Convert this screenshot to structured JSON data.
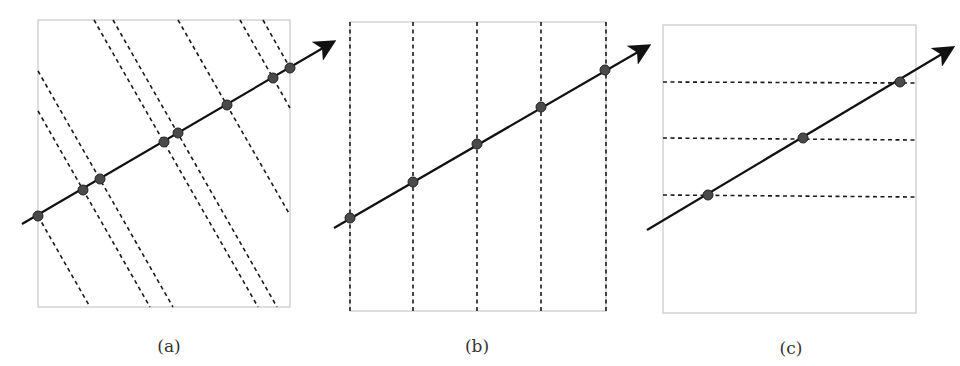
{
  "figure": {
    "panels": [
      {
        "id": "a",
        "label": "(a)",
        "label_pos": [
          169,
          350
        ],
        "box": {
          "x0": 38,
          "y0": 20,
          "x1": 290,
          "y1": 307
        },
        "axis": {
          "from": [
            22,
            224
          ],
          "to": [
            323,
            48
          ]
        },
        "projection": "oblique",
        "dashed_lines": [
          {
            "from": [
              38,
              216
            ],
            "to": [
              90,
              307
            ]
          },
          {
            "from": [
              38,
              111
            ],
            "to": [
              150,
              307
            ]
          },
          {
            "from": [
              38,
              71
            ],
            "to": [
              173,
              307
            ]
          },
          {
            "from": [
              94,
              20
            ],
            "to": [
              258,
              307
            ]
          },
          {
            "from": [
              113,
              20
            ],
            "to": [
              277,
              307
            ]
          },
          {
            "from": [
              178,
              20
            ],
            "to": [
              290,
              215
            ]
          },
          {
            "from": [
              240,
              20
            ],
            "to": [
              290,
              108
            ]
          },
          {
            "from": [
              263,
              20
            ],
            "to": [
              290,
              68
            ]
          }
        ],
        "points": [
          [
            38,
            216
          ],
          [
            83,
            190
          ],
          [
            100,
            179
          ],
          [
            164,
            142
          ],
          [
            178,
            133
          ],
          [
            227,
            105
          ],
          [
            273,
            78
          ],
          [
            290,
            68
          ]
        ]
      },
      {
        "id": "b",
        "label": "(b)",
        "label_pos": [
          477,
          350
        ],
        "box": {
          "x0": 350,
          "y0": 22,
          "x1": 606,
          "y1": 311
        },
        "axis": {
          "from": [
            334,
            228
          ],
          "to": [
            638,
            52
          ]
        },
        "projection": "vertical",
        "dashed_lines": [
          {
            "from": [
              350,
              22
            ],
            "to": [
              350,
              311
            ]
          },
          {
            "from": [
              413,
              22
            ],
            "to": [
              413,
              311
            ]
          },
          {
            "from": [
              477,
              22
            ],
            "to": [
              477,
              311
            ]
          },
          {
            "from": [
              541,
              22
            ],
            "to": [
              541,
              311
            ]
          },
          {
            "from": [
              606,
              22
            ],
            "to": [
              606,
              311
            ]
          }
        ],
        "points": [
          [
            350,
            218
          ],
          [
            413,
            182
          ],
          [
            477,
            144
          ],
          [
            541,
            107
          ],
          [
            605,
            70
          ]
        ]
      },
      {
        "id": "c",
        "label": "(c)",
        "label_pos": [
          791,
          352
        ],
        "box": {
          "x0": 663,
          "y0": 25,
          "x1": 916,
          "y1": 313
        },
        "axis": {
          "from": [
            647,
            230
          ],
          "to": [
            942,
            54
          ]
        },
        "projection": "horizontal",
        "dashed_lines": [
          {
            "from": [
              663,
              82
            ],
            "to": [
              916,
              83
            ]
          },
          {
            "from": [
              663,
              138
            ],
            "to": [
              916,
              140
            ]
          },
          {
            "from": [
              663,
              195
            ],
            "to": [
              916,
              197
            ]
          }
        ],
        "points": [
          [
            708,
            195
          ],
          [
            803,
            138
          ],
          [
            900,
            82
          ]
        ]
      }
    ],
    "colors": {
      "box_stroke": "#c8c8c8",
      "dash_stroke": "#1a1a1a",
      "axis_stroke": "#111111",
      "point_fill": "#4a4a4a",
      "point_stroke": "#222222",
      "label_color": "#333333"
    }
  }
}
